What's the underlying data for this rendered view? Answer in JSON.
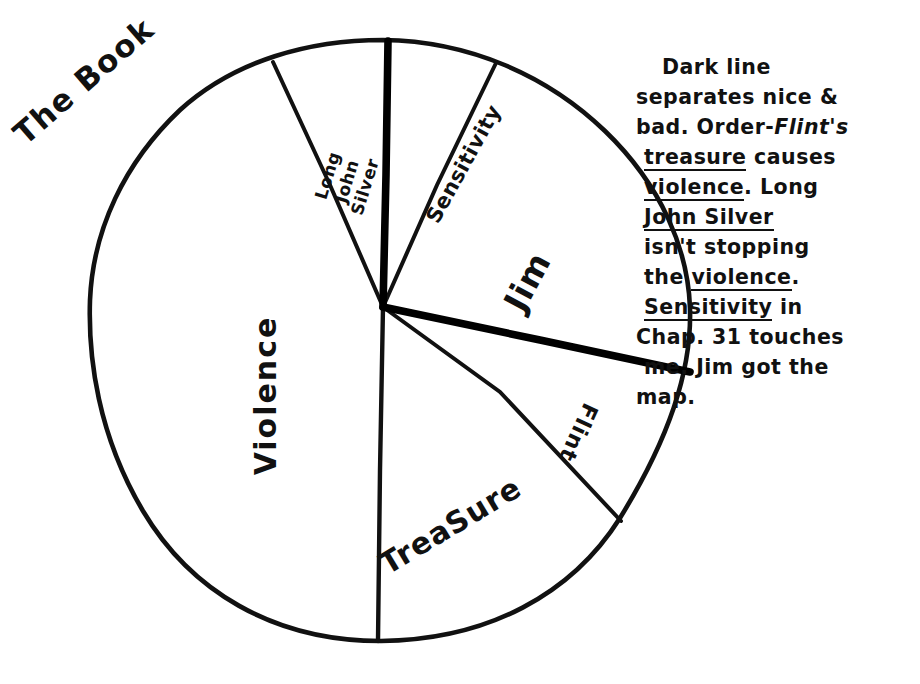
{
  "title": "The Book",
  "chart_data": {
    "type": "pie",
    "title": "The Book",
    "categories": [
      "Long John Silver",
      "Sensitivity",
      "Jim",
      "Flint",
      "Treasure",
      "Violence"
    ],
    "values": [
      6.7,
      6.7,
      21.7,
      6.4,
      15.3,
      43.3
    ],
    "value_unit": "percent",
    "angles_deg": [
      24,
      24,
      78,
      23,
      55,
      156
    ],
    "labels": {
      "violence": "Violence",
      "treasure": "TreaSure",
      "flint": "Flint",
      "jim": "Jim",
      "sensitivity": "Sensitivity",
      "long_john_silver_line1": "Long",
      "long_john_silver_line2": "John",
      "long_john_silver_line3": "Silver"
    },
    "legend": "none",
    "grid": false,
    "style": "hand-drawn",
    "stroke_color": "#111111",
    "fill_color": "#ffffff",
    "emphasis_stroke_color": "#000000",
    "emphasis_note": "Dark thick line separates nice & bad; runs from top of circle through center out to the right edge."
  },
  "annotation": {
    "lines": [
      {
        "id": "l1",
        "indent": "center0",
        "parts": [
          {
            "t": "Dark  line"
          }
        ]
      },
      {
        "id": "l2",
        "indent": "",
        "parts": [
          {
            "t": "separates nice &"
          }
        ]
      },
      {
        "id": "l3",
        "indent": "",
        "parts": [
          {
            "t": "bad. Order-"
          },
          {
            "t": "Flint's",
            "style": "italic"
          }
        ]
      },
      {
        "id": "l4",
        "indent": "indent1",
        "parts": [
          {
            "t": "treasure",
            "style": "underline"
          },
          {
            "t": " causes"
          }
        ]
      },
      {
        "id": "l5",
        "indent": "indent1",
        "parts": [
          {
            "t": "violence",
            "style": "underline"
          },
          {
            "t": ". Long"
          }
        ]
      },
      {
        "id": "l6",
        "indent": "indent1",
        "parts": [
          {
            "t": "John  Silver",
            "style": "underline"
          }
        ]
      },
      {
        "id": "l7",
        "indent": "indent1",
        "parts": [
          {
            "t": "isn't stopping"
          }
        ]
      },
      {
        "id": "l8",
        "indent": "indent1",
        "parts": [
          {
            "t": "the "
          },
          {
            "t": "violence",
            "style": "underline"
          },
          {
            "t": "."
          }
        ]
      },
      {
        "id": "l9",
        "indent": "indent1",
        "parts": [
          {
            "t": "Sensitivity",
            "style": "underline"
          },
          {
            "t": " in"
          }
        ]
      },
      {
        "id": "l10",
        "indent": "",
        "parts": [
          {
            "t": "Chap. 31 touches"
          }
        ]
      },
      {
        "id": "l11",
        "indent": "indent1",
        "parts": [
          {
            "t": "me. Jim got the"
          }
        ]
      },
      {
        "id": "l12",
        "indent": "",
        "parts": [
          {
            "t": "map."
          }
        ]
      }
    ]
  }
}
